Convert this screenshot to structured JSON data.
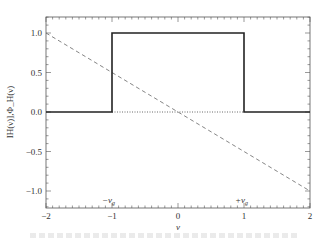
{
  "chart_data": {
    "type": "line",
    "title": "",
    "xlabel": "ν",
    "ylabel": "IH(ν)],Φ_H(ν)",
    "xlim": [
      -2,
      2
    ],
    "ylim": [
      -1.2,
      1.2
    ],
    "xticks": [
      "−2",
      "−1",
      "0",
      "1",
      "2"
    ],
    "yticks": [
      "1.0",
      "0.5",
      "0.0",
      "−0.5",
      "−1.0"
    ],
    "grid": false,
    "series": [
      {
        "name": "|H(ν)| (boxcar magnitude)",
        "style": "solid",
        "x": [
          -2,
          -1,
          -1,
          1,
          1,
          2
        ],
        "y": [
          0,
          0,
          1,
          1,
          0,
          0
        ]
      },
      {
        "name": "Φ_H(ν) (phase)",
        "style": "dashed",
        "x": [
          -2,
          2
        ],
        "y": [
          1,
          -1
        ]
      },
      {
        "name": "zero line",
        "style": "dotted",
        "x": [
          -1,
          1
        ],
        "y": [
          0,
          0
        ]
      }
    ],
    "annotations": [
      {
        "text": "−ν_g",
        "x": -1,
        "y": -1.0
      },
      {
        "text": "+ν_g",
        "x": 1,
        "y": -1.0
      }
    ]
  },
  "labels": {
    "x_axis": "ν",
    "y_axis": "IH(ν)],Φ_H(ν)",
    "ann_left": "−ν",
    "ann_left_sub": "g",
    "ann_right": "+ν",
    "ann_right_sub": "g",
    "xt0": "−2",
    "xt1": "−1",
    "xt2": "0",
    "xt3": "1",
    "xt4": "2",
    "yt0": "1.0",
    "yt1": "0.5",
    "yt2": "0.0",
    "yt3": "−0.5",
    "yt4": "−1.0"
  }
}
